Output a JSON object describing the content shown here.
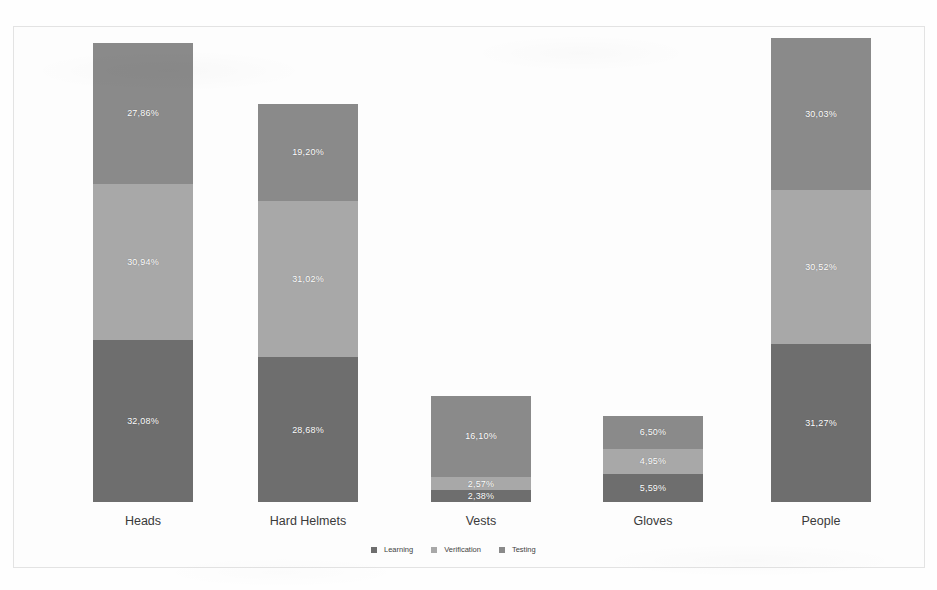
{
  "chart_data": {
    "type": "bar",
    "subtype": "stacked-bar",
    "title": "",
    "subtitle": "",
    "xlabel": "",
    "ylabel": "",
    "grid": false,
    "legend_position": "bottom-center",
    "value_format": "percent-comma-decimal",
    "categories": [
      "Heads",
      "Hard Helmets",
      "Vests",
      "Gloves",
      "People"
    ],
    "series": [
      {
        "name": "Learning",
        "color": "#6e6e6e",
        "stack_order": 0,
        "values": [
          32.08,
          28.68,
          2.38,
          5.59,
          31.27
        ],
        "labels": [
          "32,08%",
          "28,68%",
          "2,38%",
          "5,59%",
          "31,27%"
        ]
      },
      {
        "name": "Verification",
        "color": "#a8a8a8",
        "stack_order": 1,
        "values": [
          30.94,
          31.02,
          2.57,
          4.95,
          30.52
        ],
        "labels": [
          "30,94%",
          "31,02%",
          "2,57%",
          "4,95%",
          "30,52%"
        ]
      },
      {
        "name": "Testing",
        "color": "#8a8a8a",
        "stack_order": 2,
        "values": [
          27.86,
          19.2,
          16.1,
          6.5,
          30.03
        ],
        "labels": [
          "27,86%",
          "19,20%",
          "16,10%",
          "6,50%",
          "30,03%"
        ]
      }
    ],
    "totals": [
      90.88,
      78.9,
      21.05,
      17.04,
      91.82
    ],
    "ylim": [
      0,
      92
    ]
  },
  "legend": {
    "items": [
      {
        "label": "Learning",
        "color": "#6e6e6e"
      },
      {
        "label": "Verification",
        "color": "#a8a8a8"
      },
      {
        "label": "Testing",
        "color": "#8a8a8a"
      }
    ]
  },
  "columns": [
    {
      "category": "Heads",
      "left": 40,
      "segments": [
        {
          "series": "Testing",
          "label": "27,86%",
          "value": 27.86,
          "color": "#8a8a8a"
        },
        {
          "series": "Verification",
          "label": "30,94%",
          "value": 30.94,
          "color": "#a8a8a8"
        },
        {
          "series": "Learning",
          "label": "32,08%",
          "value": 32.08,
          "color": "#6e6e6e"
        }
      ]
    },
    {
      "category": "Hard Helmets",
      "left": 205,
      "segments": [
        {
          "series": "Testing",
          "label": "19,20%",
          "value": 19.2,
          "color": "#8a8a8a"
        },
        {
          "series": "Verification",
          "label": "31,02%",
          "value": 31.02,
          "color": "#a8a8a8"
        },
        {
          "series": "Learning",
          "label": "28,68%",
          "value": 28.68,
          "color": "#6e6e6e"
        }
      ]
    },
    {
      "category": "Vests",
      "left": 378,
      "segments": [
        {
          "series": "Testing",
          "label": "16,10%",
          "value": 16.1,
          "color": "#8a8a8a"
        },
        {
          "series": "Verification",
          "label": "2,57%",
          "value": 2.57,
          "color": "#a8a8a8"
        },
        {
          "series": "Learning",
          "label": "2,38%",
          "value": 2.38,
          "color": "#6e6e6e"
        }
      ]
    },
    {
      "category": "Gloves",
      "left": 550,
      "segments": [
        {
          "series": "Testing",
          "label": "6,50%",
          "value": 6.5,
          "color": "#8a8a8a"
        },
        {
          "series": "Verification",
          "label": "4,95%",
          "value": 4.95,
          "color": "#a8a8a8"
        },
        {
          "series": "Learning",
          "label": "5,59%",
          "value": 5.59,
          "color": "#6e6e6e"
        }
      ]
    },
    {
      "category": "People",
      "left": 718,
      "segments": [
        {
          "series": "Testing",
          "label": "30,03%",
          "value": 30.03,
          "color": "#8a8a8a"
        },
        {
          "series": "Verification",
          "label": "30,52%",
          "value": 30.52,
          "color": "#a8a8a8"
        },
        {
          "series": "Learning",
          "label": "31,27%",
          "value": 31.27,
          "color": "#6e6e6e"
        }
      ]
    }
  ],
  "scale": {
    "px_per_percent": 5.05
  }
}
